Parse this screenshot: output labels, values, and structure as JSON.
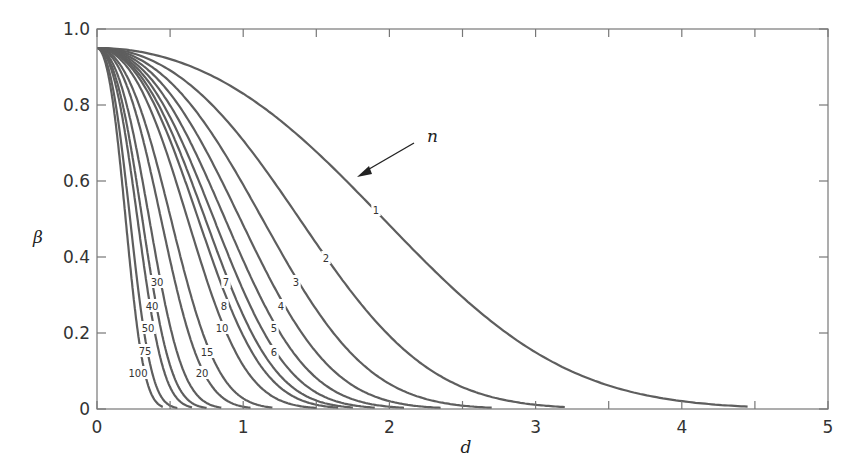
{
  "chart_data": {
    "type": "line",
    "title": "",
    "xlabel": "d",
    "ylabel": "β",
    "xlim": [
      0,
      5
    ],
    "ylim": [
      0,
      1.0
    ],
    "x_ticks": [
      "0",
      "1",
      "2",
      "3",
      "4",
      "5"
    ],
    "y_ticks": [
      "0",
      "0.2",
      "0.4",
      "0.6",
      "0.8",
      "1.0"
    ],
    "grid": false,
    "legend": "inline curve labels",
    "annotation": {
      "text": "n",
      "arrow": true
    },
    "z_alpha_half": 1.96,
    "beta_at_d0": 0.95,
    "series": [
      {
        "name": "1",
        "n": 1,
        "label": "1",
        "label_pos": [
          376,
          210
        ],
        "zero_at_d": 4.45
      },
      {
        "name": "2",
        "n": 2,
        "label": "2",
        "label_pos": [
          326,
          258
        ],
        "zero_at_d": 3.2
      },
      {
        "name": "3",
        "n": 3,
        "label": "3",
        "label_pos": [
          296,
          282
        ],
        "zero_at_d": 2.7
      },
      {
        "name": "4",
        "n": 4,
        "label": "4",
        "label_pos": [
          281,
          306
        ],
        "zero_at_d": 2.35
      },
      {
        "name": "5",
        "n": 5,
        "label": "5",
        "label_pos": [
          274,
          328
        ],
        "zero_at_d": 2.1
      },
      {
        "name": "6",
        "n": 6,
        "label": "6",
        "label_pos": [
          274,
          352
        ],
        "zero_at_d": 1.9
      },
      {
        "name": "7",
        "n": 7,
        "label": "7",
        "label_pos": [
          226,
          282
        ],
        "zero_at_d": 1.75
      },
      {
        "name": "8",
        "n": 8,
        "label": "8",
        "label_pos": [
          224,
          306
        ],
        "zero_at_d": 1.65
      },
      {
        "name": "10",
        "n": 10,
        "label": "10",
        "label_pos": [
          222,
          328
        ],
        "zero_at_d": 1.5
      },
      {
        "name": "15",
        "n": 15,
        "label": "15",
        "label_pos": [
          207,
          352
        ],
        "zero_at_d": 1.2
      },
      {
        "name": "20",
        "n": 20,
        "label": "20",
        "label_pos": [
          202,
          373
        ],
        "zero_at_d": 1.05
      },
      {
        "name": "30",
        "n": 30,
        "label": "30",
        "label_pos": [
          157,
          282
        ],
        "zero_at_d": 0.85
      },
      {
        "name": "40",
        "n": 40,
        "label": "40",
        "label_pos": [
          152,
          306
        ],
        "zero_at_d": 0.75
      },
      {
        "name": "50",
        "n": 50,
        "label": "50",
        "label_pos": [
          148,
          328
        ],
        "zero_at_d": 0.65
      },
      {
        "name": "75",
        "n": 75,
        "label": "75",
        "label_pos": [
          145,
          351
        ],
        "zero_at_d": 0.55
      },
      {
        "name": "100",
        "n": 100,
        "label": "100",
        "label_pos": [
          138,
          373
        ],
        "zero_at_d": 0.45
      }
    ]
  },
  "colors": {
    "curve": "#5e5e5e",
    "frame": "#777777",
    "text": "#333333",
    "background": "#ffffff"
  }
}
